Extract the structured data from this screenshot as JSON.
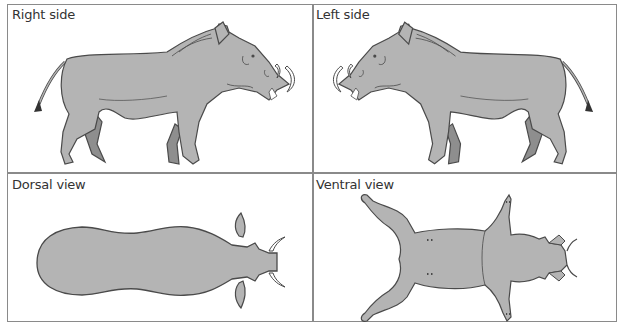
{
  "figure": {
    "panels": [
      {
        "id": "right-side",
        "label": "Right side"
      },
      {
        "id": "left-side",
        "label": "Left side"
      },
      {
        "id": "dorsal-view",
        "label": "Dorsal view"
      },
      {
        "id": "ventral-view",
        "label": "Ventral view"
      }
    ],
    "colors": {
      "body_fill": "#b4b4b4",
      "far_leg_fill": "#8e8e8e",
      "outline": "#4a4a4a",
      "tusk_fill": "#ffffff",
      "border": "#8a8a8a"
    }
  }
}
